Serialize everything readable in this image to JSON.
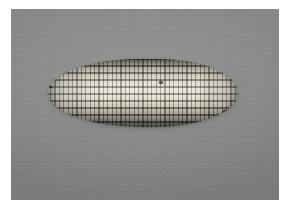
{
  "image": {
    "subject": "corn cob",
    "subject_label": "Ear of maize (corn cob) lying horizontally",
    "caption": "",
    "background_label": "Plain gray studio backdrop",
    "orientation": "horizontal",
    "canvas": {
      "width": 284,
      "height": 205
    },
    "border": {
      "color": "#ffffff",
      "left": 11,
      "top": 9,
      "right": 5,
      "bottom": 5
    },
    "colors": {
      "page_background": "#ffffff",
      "backdrop_gray": "#8b8b8b",
      "backdrop_gray_light": "#919191",
      "backdrop_gray_dark": "#828282",
      "kernel_highlight": "#e6e2d3",
      "kernel_midtone": "#cfcbbe",
      "kernel_shadow": "#7f7e77",
      "kernel_separator": "#342c24",
      "blemish": "#33302b",
      "cast_shadow": "rgba(0,0,0,0.30)"
    },
    "subject_bounds": {
      "x": 48,
      "y": 59,
      "width": 190,
      "height": 68
    },
    "kernels": {
      "row_count": 10,
      "column_count": 43,
      "row_pitch_px": 7,
      "column_pitch_px": 4.4
    },
    "blemishes": [
      {
        "name": "left-tip-dark-kernel",
        "x": 49,
        "y": 86,
        "size": 3
      },
      {
        "name": "center-dark-kernel",
        "x": 159,
        "y": 81,
        "size": 4
      },
      {
        "name": "lower-right-dark-kernel",
        "x": 223,
        "y": 110,
        "size": 5
      }
    ]
  }
}
